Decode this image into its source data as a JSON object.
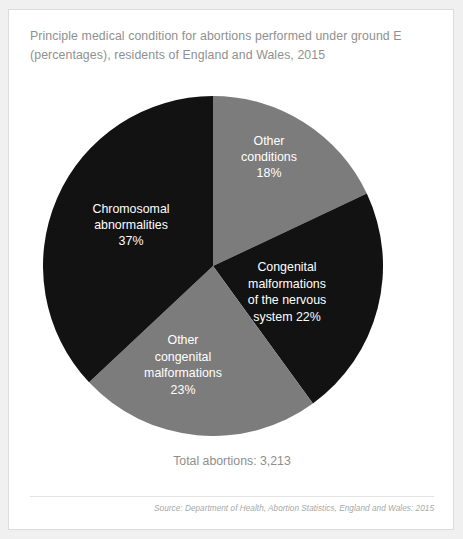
{
  "card": {
    "title_line1": "Principle medical condition for abortions performed under ground E",
    "title_line2": "(percentages), residents of England and Wales, 2015",
    "total_label": "Total abortions: 3,213",
    "source_label": "Source: Department of Health, Abortion Statistics, England and Wales: 2015"
  },
  "chart_data": {
    "type": "pie",
    "title": "Principle medical condition for abortions performed under ground E (percentages), residents of England and Wales, 2015",
    "unit": "percent",
    "total": 3213,
    "total_label": "Total abortions: 3,213",
    "start_angle_deg": 0,
    "direction": "clockwise",
    "legend_position": "none",
    "labels_inside_slices": true,
    "categories": [
      "Other conditions",
      "Congenital malformations of the nervous system",
      "Other congenital malformations",
      "Chromosomal abnormalities"
    ],
    "values": [
      18,
      22,
      23,
      37
    ],
    "colors": [
      "#7c7c7c",
      "#121212",
      "#7c7c7c",
      "#121212"
    ],
    "slices": [
      {
        "name": "Other conditions",
        "value": 18,
        "color": "#7c7c7c",
        "label_lines": [
          "Other",
          "conditions",
          "18%"
        ],
        "label_x": 226,
        "label_y": 62
      },
      {
        "name": "Congenital malformations of the nervous system",
        "value": 22,
        "color": "#121212",
        "label_lines": [
          "Congenital",
          "malformations",
          "of the nervous",
          "system 22%"
        ],
        "label_x": 244,
        "label_y": 197
      },
      {
        "name": "Other congenital malformations",
        "value": 23,
        "color": "#7c7c7c",
        "label_lines": [
          "Other",
          "congenital",
          "malformations",
          "23%"
        ],
        "label_x": 140,
        "label_y": 270
      },
      {
        "name": "Chromosomal abnormalities",
        "value": 37,
        "color": "#121212",
        "label_lines": [
          "Chromosomal",
          "abnormalities",
          "37%"
        ],
        "label_x": 88,
        "label_y": 130
      }
    ],
    "source": "Source: Department of Health, Abortion Statistics, England and Wales: 2015"
  }
}
